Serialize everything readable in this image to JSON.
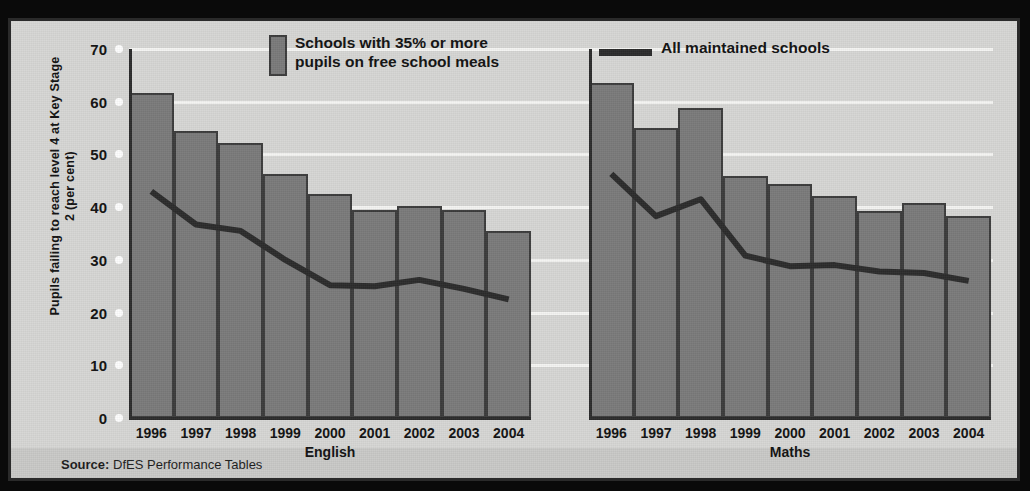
{
  "figure": {
    "background_color": "#d6d6d4",
    "frame_color": "#2a2a2a",
    "bar_color": "#7a7a7a",
    "line_color": "#2b2b2b",
    "gridline_color": "#f4f4f2"
  },
  "legend": {
    "bar_label_line1": "Schools with 35% or more",
    "bar_label_line2": "pupils on free school meals",
    "line_label": "All maintained schools"
  },
  "source": {
    "prefix": "Source:",
    "text": "DfES Performance Tables"
  },
  "chart_data": {
    "type": "bar",
    "title": "",
    "subtitle": "",
    "xlabel": "",
    "ylabel": "Pupils failing to reach level 4 at Key Stage 2 (per cent)",
    "ylim": [
      0,
      70
    ],
    "yticks": [
      0,
      10,
      20,
      30,
      40,
      50,
      60,
      70
    ],
    "grid": true,
    "legend_position": "top",
    "categories": [
      "1996",
      "1997",
      "1998",
      "1999",
      "2000",
      "2001",
      "2002",
      "2003",
      "2004"
    ],
    "panels": [
      {
        "name": "English",
        "caption": "English",
        "series": [
          {
            "name": "Schools with 35% or more pupils on free school meals",
            "type": "bar",
            "values": [
              61.6,
              54.5,
              52.2,
              46.3,
              42.5,
              39.5,
              40.3,
              39.4,
              35.5
            ]
          },
          {
            "name": "All maintained schools",
            "type": "line",
            "values": [
              43.0,
              36.7,
              35.5,
              30.0,
              25.2,
              25.0,
              26.2,
              24.5,
              22.5
            ]
          }
        ]
      },
      {
        "name": "Maths",
        "caption": "Maths",
        "series": [
          {
            "name": "Schools with 35% or more pupils on free school meals",
            "type": "bar",
            "values": [
              63.6,
              55.0,
              58.9,
              46.0,
              44.3,
              42.2,
              39.2,
              40.8,
              38.3
            ]
          },
          {
            "name": "All maintained schools",
            "type": "line",
            "values": [
              46.3,
              38.3,
              41.5,
              30.8,
              28.8,
              29.0,
              27.8,
              27.5,
              26.0
            ]
          }
        ]
      }
    ]
  }
}
